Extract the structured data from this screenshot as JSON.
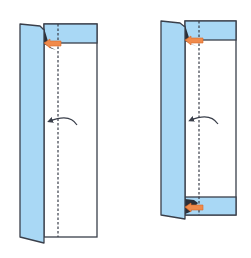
{
  "diagram": {
    "type": "folding-instructions",
    "steps": [
      {
        "id": "step-a",
        "description": "Strip with left flap folded; top edge band folded down; mountain/valley fold line dashed; curved arrow indicates folding flap leftward; orange push arrow at top corner",
        "arrows": [
          "push-arrow-top",
          "fold-arrow-curved"
        ]
      },
      {
        "id": "step-b",
        "description": "Same strip with both top and bottom bands folded; orange push arrows at top and bottom corners; curved fold arrow",
        "arrows": [
          "push-arrow-top",
          "push-arrow-bottom",
          "fold-arrow-curved"
        ]
      }
    ],
    "colors": {
      "paper_colored": "#a9d8f5",
      "paper_white": "#ffffff",
      "outline": "#3a3f4a",
      "dashed_line": "#3a3f4a",
      "push_arrow": "#f08a4b",
      "shadow": "#2b2f38"
    }
  }
}
